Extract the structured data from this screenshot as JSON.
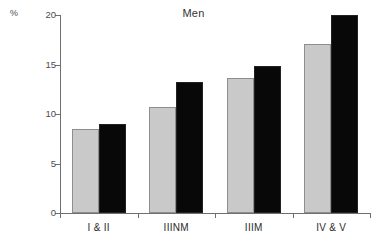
{
  "chart_data": {
    "type": "bar",
    "title": "Men",
    "xlabel": "",
    "ylabel": "%",
    "ylim": [
      0,
      20
    ],
    "yticks": [
      0,
      5,
      10,
      15,
      20
    ],
    "ytick_labels": [
      "0",
      "5",
      "10",
      "15",
      "20"
    ],
    "grid": false,
    "legend": "none",
    "categories": [
      "I & II",
      "IIINM",
      "IIIM",
      "IV & V"
    ],
    "series": [
      {
        "name": "light-gray-bar",
        "color": "#c9c9c9",
        "values": [
          8.5,
          10.7,
          13.6,
          17.1
        ]
      },
      {
        "name": "black-bar",
        "color": "#080808",
        "values": [
          9.0,
          13.2,
          14.8,
          20.0
        ]
      }
    ]
  },
  "axis": {
    "unit_label": "%",
    "axis_color": "#6f6f6f"
  }
}
